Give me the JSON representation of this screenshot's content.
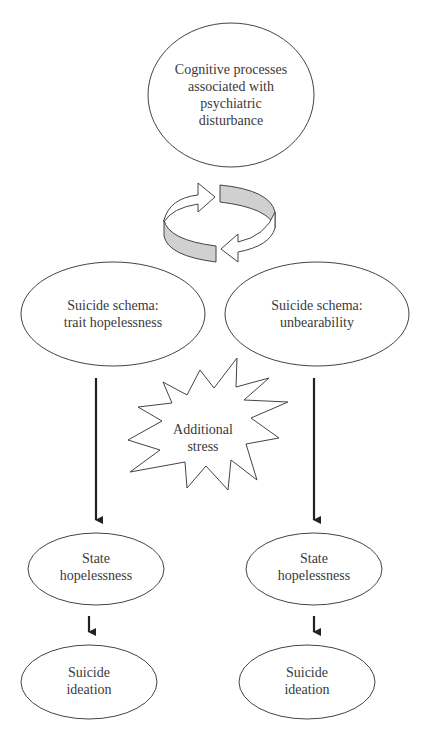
{
  "diagram": {
    "top": {
      "lines": [
        "Cognitive processes",
        "associated with",
        "psychiatric",
        "disturbance"
      ]
    },
    "cycle_icon": "circular-arrows-icon",
    "schema_left": {
      "lines": [
        "Suicide schema:",
        "trait hopelessness"
      ]
    },
    "schema_right": {
      "lines": [
        "Suicide schema:",
        "unbearability"
      ]
    },
    "stress": {
      "lines": [
        "Additional",
        "stress"
      ]
    },
    "state_left": {
      "lines": [
        "State",
        "hopelessness"
      ]
    },
    "state_right": {
      "lines": [
        "State",
        "hopelessness"
      ]
    },
    "ideation_left": {
      "lines": [
        "Suicide",
        "ideation"
      ]
    },
    "ideation_right": {
      "lines": [
        "Suicide",
        "ideation"
      ]
    },
    "colors": {
      "stroke": "#333333",
      "fill_band": "#d0d0d0",
      "background": "#ffffff"
    }
  }
}
